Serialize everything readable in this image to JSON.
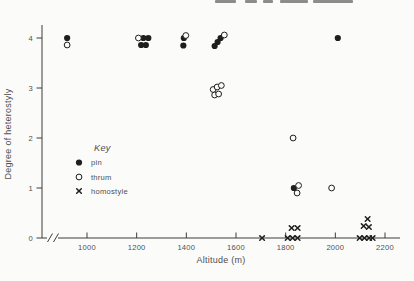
{
  "figure": {
    "title": "",
    "x_axis_label": "Altitude (m)",
    "y_axis_label": "Degree of heterostyly"
  },
  "legend": {
    "title": "Key",
    "items": [
      {
        "label": "pin",
        "marker": "filled-circle"
      },
      {
        "label": "thrum",
        "marker": "open-circle"
      },
      {
        "label": "homostyle",
        "marker": "x-cross"
      }
    ]
  },
  "chart_data": {
    "type": "scatter",
    "xlabel": "Altitude (m)",
    "ylabel": "Degree of heterostyly",
    "xlim": [
      870,
      2260
    ],
    "ylim": [
      0,
      4.3
    ],
    "x_ticks": [
      1000,
      1200,
      1400,
      1600,
      1800,
      2000,
      2200
    ],
    "y_ticks": [
      0,
      1,
      2,
      3,
      4
    ],
    "x_axis_break": true,
    "grid": false,
    "legend_position": "center-left",
    "series": [
      {
        "name": "pin",
        "marker": "filled-circle",
        "points": [
          [
            920,
            4.0
          ],
          [
            1227,
            4.0
          ],
          [
            1247,
            4.0
          ],
          [
            1218,
            3.86
          ],
          [
            1237,
            3.86
          ],
          [
            1390,
            4.0
          ],
          [
            1388,
            3.85
          ],
          [
            1538,
            4.0
          ],
          [
            1526,
            3.92
          ],
          [
            1514,
            3.84
          ],
          [
            2010,
            4.0
          ],
          [
            1833,
            1.0
          ]
        ]
      },
      {
        "name": "thrum",
        "marker": "open-circle",
        "points": [
          [
            920,
            3.86
          ],
          [
            1207,
            4.0
          ],
          [
            1398,
            4.05
          ],
          [
            1553,
            4.06
          ],
          [
            1508,
            2.97
          ],
          [
            1524,
            3.02
          ],
          [
            1541,
            3.05
          ],
          [
            1514,
            2.86
          ],
          [
            1530,
            2.88
          ],
          [
            1830,
            2.0
          ],
          [
            1852,
            1.05
          ],
          [
            1846,
            0.9
          ],
          [
            1985,
            1.0
          ]
        ]
      },
      {
        "name": "homostyle",
        "marker": "x-cross",
        "points": [
          [
            1705,
            0
          ],
          [
            1808,
            0
          ],
          [
            1828,
            0
          ],
          [
            1848,
            0
          ],
          [
            1824,
            0.2
          ],
          [
            1848,
            0.2
          ],
          [
            2098,
            0
          ],
          [
            2117,
            0
          ],
          [
            2136,
            0
          ],
          [
            2150,
            0
          ],
          [
            2114,
            0.24
          ],
          [
            2135,
            0.22
          ],
          [
            2130,
            0.38
          ]
        ]
      }
    ]
  },
  "colors": {
    "marker": "#1e1e1e",
    "axis": "#3c3c3c",
    "text": "#4f4f4f",
    "background": "#fbfbf9",
    "artifact": "#8c8c8c"
  },
  "artifacts": {
    "top_crop_segments_x": [
      [
        215,
        236
      ],
      [
        245,
        257
      ],
      [
        263,
        273
      ],
      [
        280,
        308
      ],
      [
        313,
        353
      ]
    ]
  }
}
